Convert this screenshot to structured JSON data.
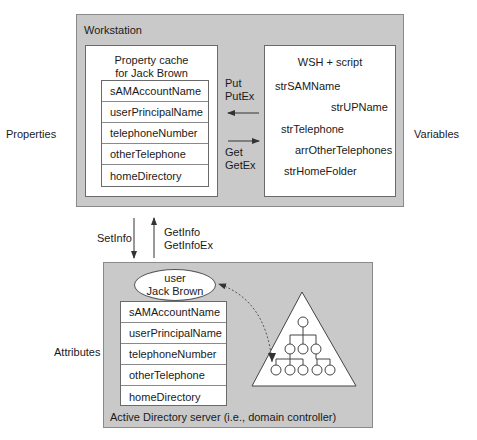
{
  "side_labels": {
    "properties": "Properties",
    "variables": "Variables",
    "attributes": "Attributes"
  },
  "workstation": {
    "title": "Workstation",
    "property_cache": {
      "title_line1": "Property cache",
      "title_line2": "for Jack Brown",
      "rows": [
        "sAMAccountName",
        "userPrincipalName",
        "telephoneNumber",
        "otherTelephone",
        "homeDirectory"
      ]
    },
    "script": {
      "title": "WSH + script",
      "variables": [
        "strSAMName",
        "strUPName",
        "strTelephone",
        "arrOtherTelephones",
        "strHomeFolder"
      ]
    },
    "arrows": {
      "put_line1": "Put",
      "put_line2": "PutEx",
      "get_line1": "Get",
      "get_line2": "GetEx"
    }
  },
  "transfer": {
    "setinfo": "SetInfo",
    "getinfo_line1": "GetInfo",
    "getinfo_line2": "GetInfoEx"
  },
  "ad_server": {
    "caption": "Active Directory server (i.e., domain controller)",
    "object": {
      "class_line": "user",
      "name_line": "Jack Brown"
    },
    "rows": [
      "sAMAccountName",
      "userPrincipalName",
      "telephoneNumber",
      "otherTelephone",
      "homeDirectory"
    ]
  },
  "colors": {
    "container_fill": "#c9c9c9",
    "box_fill": "#ffffff",
    "line": "#333333"
  }
}
